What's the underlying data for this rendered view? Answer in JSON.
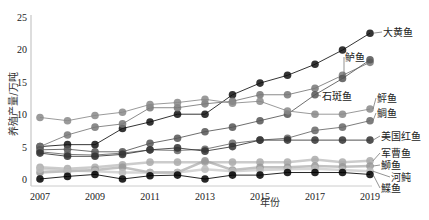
{
  "chart_data": {
    "type": "line",
    "title": "",
    "xlabel": "年份",
    "ylabel": "养殖产量/万吨",
    "ylim": [
      0,
      25
    ],
    "yticks": [
      0,
      5,
      10,
      15,
      20,
      25
    ],
    "xticks": [
      2007,
      2009,
      2011,
      2013,
      2015,
      2017,
      2019
    ],
    "x": [
      2007,
      2008,
      2009,
      2010,
      2011,
      2012,
      2013,
      2014,
      2015,
      2016,
      2017,
      2018,
      2019
    ],
    "grid": false,
    "legend_position": "inline-right",
    "series": [
      {
        "name": "大黄鱼",
        "color": "#111111",
        "values": [
          5.0,
          5.3,
          5.3,
          7.8,
          8.8,
          10.0,
          10.0,
          13.0,
          14.8,
          16.0,
          17.7,
          19.9,
          22.5
        ]
      },
      {
        "name": "鲈鱼",
        "color": "#777777",
        "values": [
          5.0,
          6.8,
          8.0,
          8.5,
          11.0,
          11.0,
          11.6,
          12.0,
          13.0,
          13.0,
          14.0,
          16.0,
          18.0
        ]
      },
      {
        "name": "石斑鱼",
        "color": "#555555",
        "values": [
          4.5,
          4.6,
          4.2,
          4.2,
          5.5,
          6.3,
          7.3,
          8.0,
          9.0,
          10.0,
          13.0,
          15.5,
          18.4
        ]
      },
      {
        "name": "鲆鱼",
        "color": "#888888",
        "values": [
          9.5,
          9.0,
          9.8,
          10.3,
          11.5,
          11.8,
          12.3,
          11.7,
          12.0,
          10.5,
          10.0,
          10.0,
          10.8
        ]
      },
      {
        "name": "鲷鱼",
        "color": "#666666",
        "values": [
          4.2,
          3.8,
          3.7,
          4.0,
          4.5,
          4.4,
          4.6,
          5.5,
          6.0,
          6.3,
          7.5,
          8.0,
          9.0
        ]
      },
      {
        "name": "美国红鱼",
        "color": "#333333",
        "values": [
          4.0,
          3.5,
          3.5,
          3.8,
          4.5,
          4.8,
          4.3,
          5.0,
          6.0,
          6.0,
          6.0,
          6.0,
          6.0
        ]
      },
      {
        "name": "军曹鱼",
        "color": "#aaaaaa",
        "values": [
          1.8,
          1.6,
          1.8,
          2.2,
          2.6,
          2.6,
          2.6,
          2.6,
          2.6,
          2.6,
          3.0,
          2.6,
          2.8
        ]
      },
      {
        "name": "鰤鱼",
        "color": "#999999",
        "values": [
          1.0,
          1.2,
          1.4,
          1.8,
          1.0,
          1.0,
          2.8,
          1.4,
          1.8,
          1.8,
          2.0,
          1.9,
          2.0
        ]
      },
      {
        "name": "河鲀",
        "color": "#bbbbbb",
        "values": [
          1.5,
          1.3,
          1.2,
          1.0,
          1.0,
          1.0,
          1.5,
          1.2,
          1.4,
          1.5,
          1.6,
          1.4,
          1.2
        ]
      },
      {
        "name": "鰈鱼",
        "color": "#000000",
        "values": [
          0.0,
          0.4,
          0.7,
          0.0,
          0.5,
          0.6,
          0.0,
          0.6,
          0.6,
          1.0,
          1.0,
          1.0,
          0.7
        ]
      }
    ],
    "annotations": [
      {
        "text": "大黄鱼",
        "x": 2019,
        "y": 22.5
      },
      {
        "text": "鲈鱼",
        "x": 2018.3,
        "y": 18.8
      },
      {
        "text": "石斑鱼",
        "x": 2017,
        "y": 13.0
      },
      {
        "text": "鲆鱼",
        "x": 2019,
        "y": 12.0
      },
      {
        "text": "鲷鱼",
        "x": 2019,
        "y": 10.5
      },
      {
        "text": "美国红鱼",
        "x": 2019,
        "y": 6.0
      },
      {
        "text": "军曹鱼",
        "x": 2019,
        "y": 3.8
      },
      {
        "text": "鰤鱼",
        "x": 2019,
        "y": 2.0
      },
      {
        "text": "河鲀",
        "x": 2019,
        "y": 1.0
      },
      {
        "text": "鰈鱼",
        "x": 2019,
        "y": -0.2
      }
    ]
  }
}
